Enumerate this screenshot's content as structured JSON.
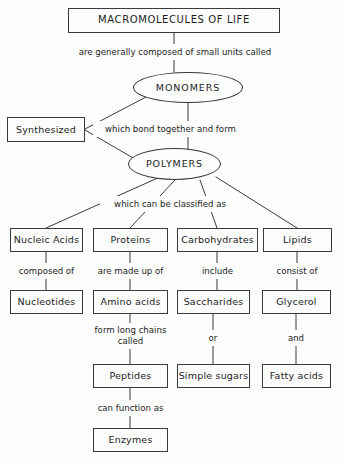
{
  "diagram": {
    "title": "MACROMOLECULES OF LIFE",
    "nodes": {
      "macromolecules": "MACROMOLECULES OF LIFE",
      "monomers": "MONOMERS",
      "polymers": "POLYMERS",
      "synthesized": "Synthesized",
      "nucleic_acids": "Nucleic Acids",
      "proteins": "Proteins",
      "carbohydrates": "Carbohydrates",
      "lipids": "Lipids",
      "nucleotides": "Nucleotides",
      "amino_acids": "Amino acids",
      "saccharides": "Saccharides",
      "glycerol": "Glycerol",
      "peptides": "Peptides",
      "simple_sugars": "Simple sugars",
      "fatty_acids": "Fatty acids",
      "enzymes": "Enzymes"
    },
    "edge_labels": {
      "composed_small_units": "are generally composed of small units called",
      "bond_together": "which bond together and form",
      "classified_as": "which can be classified as",
      "composed_of": "composed of",
      "made_up_of": "are made up of",
      "include": "include",
      "consist_of": "consist of",
      "form_long_chains": "form long chains called",
      "or": "or",
      "and": "and",
      "can_function_as": "can function as"
    },
    "colors": {
      "stroke": "#3a3a3a",
      "text": "#1c1c1c",
      "background": "#fdfdfd"
    }
  }
}
